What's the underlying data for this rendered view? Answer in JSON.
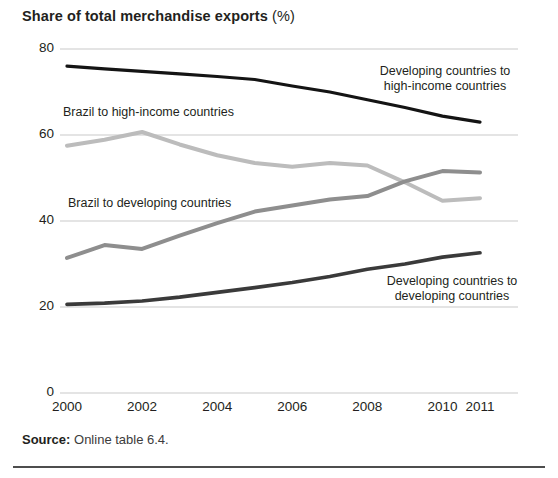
{
  "title": {
    "main": "Share of total merchandise exports",
    "unit": "(%)"
  },
  "source": {
    "label": "Source:",
    "text": "Online table 6.4."
  },
  "axes": {
    "y_ticks": [
      "0",
      "20",
      "40",
      "60",
      "80"
    ],
    "x_ticks": [
      "2000",
      "2002",
      "2004",
      "2006",
      "2008",
      "2010",
      "2011"
    ]
  },
  "series_labels": {
    "dev_to_high": [
      "Developing countries to",
      "high-income countries"
    ],
    "brazil_to_high": [
      "Brazil to high-income countries"
    ],
    "brazil_to_dev": [
      "Brazil to developing countries"
    ],
    "dev_to_dev": [
      "Developing countries to",
      "developing countries"
    ]
  },
  "chart_data": {
    "type": "line",
    "title": "Share of total merchandise exports (%)",
    "xlabel": "",
    "ylabel": "Share of total merchandise exports (%)",
    "ylim": [
      0,
      80
    ],
    "yticks": [
      0,
      20,
      40,
      60,
      80
    ],
    "xlim": [
      2000,
      2011
    ],
    "xticks": [
      2000,
      2002,
      2004,
      2006,
      2008,
      2010,
      2011
    ],
    "x": [
      2000,
      2001,
      2002,
      2003,
      2004,
      2005,
      2006,
      2007,
      2008,
      2009,
      2010,
      2011
    ],
    "grid": "horizontal",
    "legend": "inline-annotations",
    "series": [
      {
        "name": "Developing countries to high-income countries",
        "color": "#141414",
        "width": 3.2,
        "values": [
          76.0,
          75.4,
          74.8,
          74.2,
          73.6,
          72.9,
          71.4,
          70.0,
          68.2,
          66.4,
          64.4,
          63.0
        ]
      },
      {
        "name": "Brazil to high-income countries",
        "color": "#bcbcbc",
        "width": 4.0,
        "values": [
          57.5,
          58.9,
          60.7,
          57.8,
          55.3,
          53.5,
          52.6,
          53.5,
          52.9,
          49.0,
          44.7,
          45.3
        ]
      },
      {
        "name": "Brazil to developing countries",
        "color": "#8e8e8e",
        "width": 4.0,
        "values": [
          31.4,
          34.4,
          33.5,
          36.6,
          39.5,
          42.2,
          43.6,
          45.0,
          45.8,
          49.2,
          51.6,
          51.3
        ]
      },
      {
        "name": "Developing countries to developing countries",
        "color": "#3a3a3a",
        "width": 3.6,
        "values": [
          20.6,
          20.9,
          21.4,
          22.3,
          23.4,
          24.5,
          25.7,
          27.1,
          28.8,
          30.0,
          31.6,
          32.6
        ]
      }
    ]
  },
  "colors": {
    "gridline": "#c9c9c9",
    "text": "#231f20",
    "rule": "#4d4d4d"
  }
}
